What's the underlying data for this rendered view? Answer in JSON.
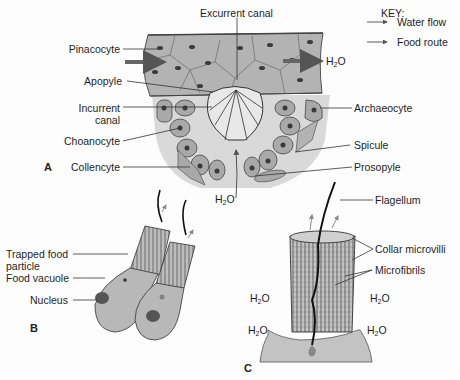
{
  "figure": {
    "panels": [
      {
        "id": "A",
        "label": "A"
      },
      {
        "id": "B",
        "label": "B"
      },
      {
        "id": "C",
        "label": "C"
      }
    ],
    "key": {
      "title": "KEY:",
      "entries": [
        {
          "label": "Water flow",
          "arrow": "water-flow-arrow"
        },
        {
          "label": "Food route",
          "arrow": "food-route-arrow"
        }
      ]
    },
    "panel_a": {
      "labels": {
        "excurrent_canal": "Excurrent canal",
        "pinacocyte": "Pinacocyte",
        "apopyle": "Apopyle",
        "incurrent_canal_1": "Incurrent",
        "incurrent_canal_2": "canal",
        "choanocyte": "Choanocyte",
        "collencyte": "Collencyte",
        "archaeocyte": "Archaeocyte",
        "spicule": "Spicule",
        "prosopyle": "Prosopyle",
        "h2o_out": "H",
        "h2o_in": "H"
      }
    },
    "panel_b": {
      "labels": {
        "trapped_food_1": "Trapped food",
        "trapped_food_2": "particle",
        "food_vacuole": "Food vacuole",
        "nucleus": "Nucleus"
      }
    },
    "panel_c": {
      "labels": {
        "flagellum": "Flagellum",
        "collar_microvilli": "Collar microvilli",
        "microfibrils": "Microfibrils",
        "h2o": "H"
      }
    },
    "colors": {
      "cell_fill": "#b4b4b4",
      "tissue_fill": "#c8c8c8",
      "nucleus": "#555555",
      "arrow": "#6e6e6e",
      "line": "#333333"
    }
  }
}
